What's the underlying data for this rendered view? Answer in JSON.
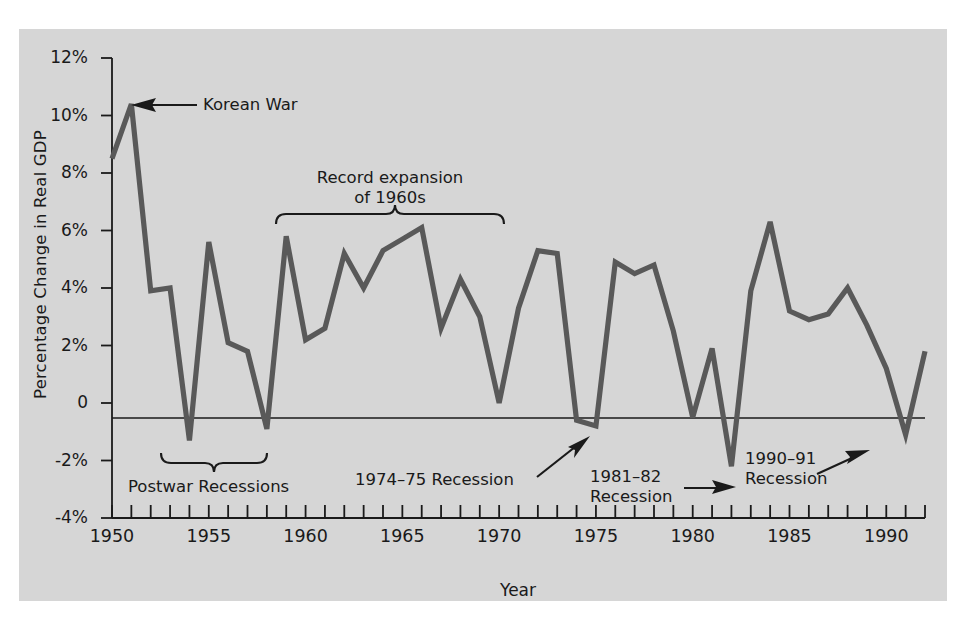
{
  "figure": {
    "background_color": "#ffffff",
    "panel_color": "#d6d6d6",
    "line_color": "#595959",
    "axis_color": "#1a1a1a"
  },
  "chart_data": {
    "type": "line",
    "title": "",
    "xlabel": "Year",
    "ylabel": "Percentage Change in Real GDP",
    "xlim": [
      1950,
      1992
    ],
    "ylim": [
      -4,
      12
    ],
    "grid": false,
    "legend": null,
    "y_tick_labels": [
      "12%",
      "10%",
      "8%",
      "6%",
      "4%",
      "2%",
      "0",
      "-2%",
      "-4%"
    ],
    "y_tick_values": [
      12,
      10,
      8,
      6,
      4,
      2,
      0,
      -2,
      -4
    ],
    "x_tick_labels": [
      "1950",
      "1955",
      "1960",
      "1965",
      "1970",
      "1975",
      "1980",
      "1985",
      "1990"
    ],
    "x_tick_values": [
      1950,
      1955,
      1960,
      1965,
      1970,
      1975,
      1980,
      1985,
      1990
    ],
    "x_minor_tick_step": 1,
    "zero_line": true,
    "x": [
      1950,
      1951,
      1952,
      1953,
      1954,
      1955,
      1956,
      1957,
      1958,
      1959,
      1960,
      1961,
      1962,
      1963,
      1964,
      1965,
      1966,
      1967,
      1968,
      1969,
      1970,
      1971,
      1972,
      1973,
      1974,
      1975,
      1976,
      1977,
      1978,
      1979,
      1980,
      1981,
      1982,
      1983,
      1984,
      1985,
      1986,
      1987,
      1988,
      1989,
      1990,
      1991,
      1992
    ],
    "values": [
      8.5,
      10.4,
      3.9,
      4.0,
      -1.3,
      5.6,
      2.1,
      1.8,
      -0.9,
      5.8,
      2.2,
      2.6,
      5.2,
      4.0,
      5.3,
      5.7,
      6.1,
      2.6,
      4.3,
      3.0,
      0.0,
      3.3,
      5.3,
      5.2,
      -0.6,
      -0.8,
      4.9,
      4.5,
      4.8,
      2.5,
      -0.5,
      1.9,
      -2.2,
      3.9,
      6.3,
      3.2,
      2.9,
      3.1,
      4.0,
      2.7,
      1.2,
      -1.1,
      1.8
    ]
  },
  "annotations": [
    {
      "id": "korean-war",
      "text": "Korean War",
      "arrow": "left"
    },
    {
      "id": "record-expansion",
      "text": "Record expansion\nof 1960s",
      "arrow": "brace-down"
    },
    {
      "id": "postwar-recessions",
      "text": "Postwar Recessions",
      "arrow": "brace-up"
    },
    {
      "id": "recession-1974-75",
      "text": "1974–75 Recession",
      "arrow": "up-right"
    },
    {
      "id": "recession-1981-82",
      "text": "1981–82\nRecession",
      "arrow": "right"
    },
    {
      "id": "recession-1990-91",
      "text": "1990–91\nRecession",
      "arrow": "up-right"
    }
  ]
}
